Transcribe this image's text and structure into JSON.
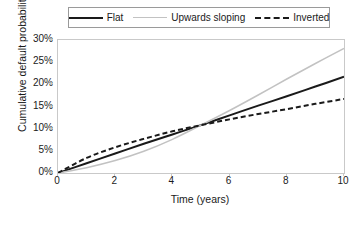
{
  "chart_data": {
    "type": "line",
    "title": "",
    "xlabel": "Time (years)",
    "ylabel": "Cumulative default probability",
    "xlim": [
      0,
      10
    ],
    "ylim": [
      0,
      0.3
    ],
    "grid": false,
    "legend_position": "top-center",
    "x_ticks": [
      "0",
      "2",
      "4",
      "6",
      "8",
      "10"
    ],
    "x_tick_values": [
      0,
      2,
      4,
      6,
      8,
      10
    ],
    "y_ticks": [
      "0%",
      "5%",
      "10%",
      "15%",
      "20%",
      "25%",
      "30%"
    ],
    "y_tick_values": [
      0,
      5,
      10,
      15,
      20,
      25,
      30
    ],
    "x": [
      0,
      1,
      2,
      3,
      4,
      5,
      6,
      7,
      8,
      9,
      10
    ],
    "series": [
      {
        "name": "Flat",
        "style": "solid",
        "color": "#1a1a1a",
        "width": 2,
        "values": [
          0.0,
          2.2,
          4.4,
          6.6,
          8.7,
          10.8,
          13.0,
          15.2,
          17.3,
          19.5,
          21.7
        ]
      },
      {
        "name": "Upwards sloping",
        "style": "solid",
        "color": "#c2c2c2",
        "width": 1.5,
        "values": [
          0.0,
          1.2,
          2.8,
          4.9,
          7.6,
          10.8,
          14.1,
          17.6,
          21.2,
          24.7,
          28.1
        ]
      },
      {
        "name": "Inverted",
        "style": "dashed",
        "color": "#1a1a1a",
        "width": 2,
        "values": [
          0.0,
          3.4,
          5.8,
          7.7,
          9.4,
          10.8,
          12.1,
          13.3,
          14.4,
          15.6,
          16.7
        ]
      }
    ]
  },
  "legend": {
    "items": [
      {
        "label": "Flat",
        "swatch": "solid-black-line-icon"
      },
      {
        "label": "Upwards sloping",
        "swatch": "solid-gray-line-icon"
      },
      {
        "label": "Inverted",
        "swatch": "dashed-black-line-icon"
      }
    ]
  },
  "axes": {
    "x_title": "Time (years)",
    "y_title": "Cumulative default probability"
  }
}
